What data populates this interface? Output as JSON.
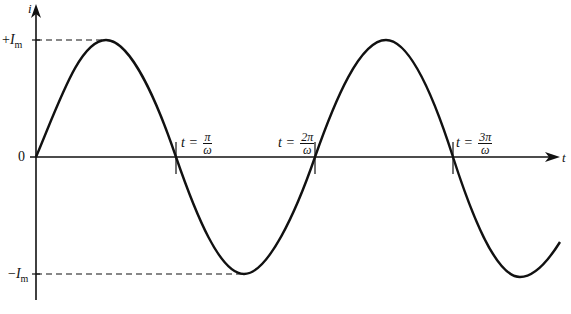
{
  "diagram": {
    "type": "sinusoidal current waveform",
    "axes": {
      "y_label": "i",
      "x_label": "t",
      "origin_label": "0"
    },
    "levels": {
      "positive_peak": {
        "sign": "+",
        "symbol": "I",
        "subscript": "m"
      },
      "negative_peak": {
        "sign": "−",
        "symbol": "I",
        "subscript": "m"
      }
    },
    "time_markers": [
      {
        "prefix": "t =",
        "numerator": "π",
        "denominator": "ω"
      },
      {
        "prefix": "t =",
        "numerator": "2π",
        "denominator": "ω"
      },
      {
        "prefix": "t =",
        "numerator": "3π",
        "denominator": "ω"
      }
    ],
    "colors": {
      "line": "#111111",
      "background": "#ffffff"
    }
  }
}
